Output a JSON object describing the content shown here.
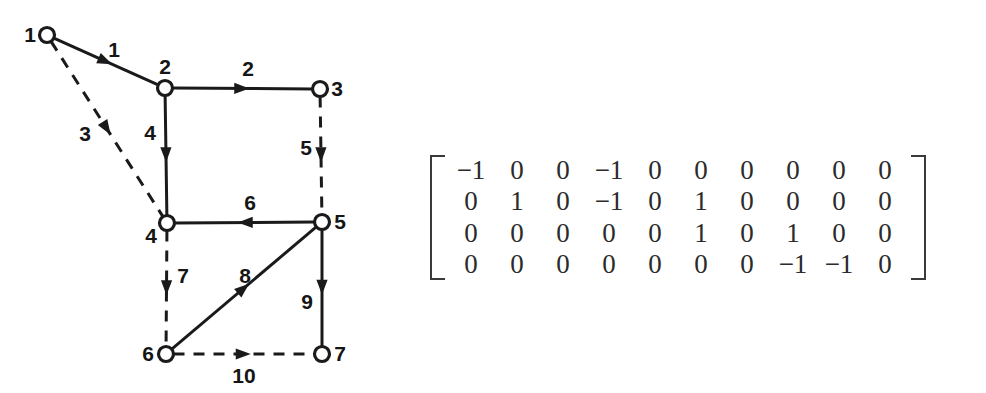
{
  "figure": {
    "graph": {
      "nodes": [
        {
          "id": "1",
          "label": "1",
          "cx": 47,
          "cy": 35,
          "label_x": 30,
          "label_y": 42,
          "label_anchor": "middle"
        },
        {
          "id": "2",
          "label": "2",
          "cx": 165,
          "cy": 88,
          "label_x": 165,
          "label_y": 74,
          "label_anchor": "middle"
        },
        {
          "id": "3",
          "label": "3",
          "cx": 320,
          "cy": 89,
          "label_x": 337,
          "label_y": 96,
          "label_anchor": "middle"
        },
        {
          "id": "4",
          "label": "4",
          "cx": 167,
          "cy": 223,
          "label_x": 151,
          "label_y": 243,
          "label_anchor": "middle"
        },
        {
          "id": "5",
          "label": "5",
          "cx": 322,
          "cy": 222,
          "label_x": 340,
          "label_y": 229,
          "label_anchor": "middle"
        },
        {
          "id": "6",
          "label": "6",
          "cx": 166,
          "cy": 354,
          "label_x": 148,
          "label_y": 361,
          "label_anchor": "middle"
        },
        {
          "id": "7",
          "label": "7",
          "cx": 322,
          "cy": 354,
          "label_x": 340,
          "label_y": 361,
          "label_anchor": "middle"
        }
      ],
      "edges": [
        {
          "id": "1",
          "label": "1",
          "from": "1",
          "to": "2",
          "style": "solid",
          "label_x": 114,
          "label_y": 57
        },
        {
          "id": "2",
          "label": "2",
          "from": "2",
          "to": "3",
          "style": "solid",
          "label_x": 248,
          "label_y": 76
        },
        {
          "id": "3",
          "label": "3",
          "from": "1",
          "to": "4",
          "style": "dashed",
          "label_x": 85,
          "label_y": 141
        },
        {
          "id": "4",
          "label": "4",
          "from": "2",
          "to": "4",
          "style": "solid",
          "label_x": 150,
          "label_y": 140
        },
        {
          "id": "5",
          "label": "5",
          "from": "3",
          "to": "5",
          "style": "dashed",
          "label_x": 306,
          "label_y": 155
        },
        {
          "id": "6",
          "label": "6",
          "from": "5",
          "to": "4",
          "style": "solid",
          "label_x": 250,
          "label_y": 210
        },
        {
          "id": "7",
          "label": "7",
          "from": "4",
          "to": "6",
          "style": "dashed",
          "label_x": 183,
          "label_y": 283
        },
        {
          "id": "8",
          "label": "8",
          "from": "6",
          "to": "5",
          "style": "solid",
          "label_x": 245,
          "label_y": 283
        },
        {
          "id": "9",
          "label": "9",
          "from": "5",
          "to": "7",
          "style": "solid",
          "label_x": 307,
          "label_y": 309
        },
        {
          "id": "10",
          "label": "10",
          "from": "6",
          "to": "7",
          "style": "dashed",
          "label_x": 244,
          "label_y": 383
        }
      ]
    },
    "matrix": {
      "rows": [
        [
          "−1",
          "0",
          "0",
          "−1",
          "0",
          "0",
          "0",
          "0",
          "0",
          "0"
        ],
        [
          "0",
          "1",
          "0",
          "−1",
          "0",
          "1",
          "0",
          "0",
          "0",
          "0"
        ],
        [
          "0",
          "0",
          "0",
          "0",
          "0",
          "1",
          "0",
          "1",
          "0",
          "0"
        ],
        [
          "0",
          "0",
          "0",
          "0",
          "0",
          "0",
          "0",
          "−1",
          "−1",
          "0"
        ]
      ]
    },
    "colors": {
      "ink": "#1a1a1a",
      "matrix_ink": "#2b2b2b",
      "background": "#ffffff"
    }
  }
}
